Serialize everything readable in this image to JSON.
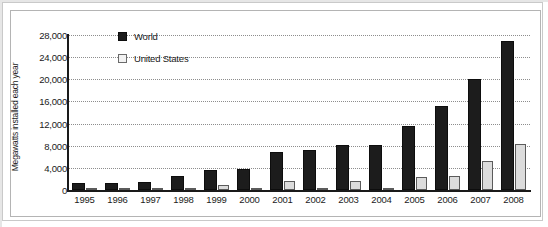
{
  "chart_data": {
    "type": "bar",
    "title": "",
    "xlabel": "",
    "ylabel": "Megawatts installed each year",
    "ylim": [
      0,
      28000
    ],
    "ytick_values": [
      0,
      4000,
      8000,
      12000,
      16000,
      20000,
      24000,
      28000
    ],
    "ytick_labels": [
      "0",
      "4,000",
      "8,000",
      "12,000",
      "16,000",
      "20,000",
      "24,000",
      "28,000"
    ],
    "grid": true,
    "legend_position": "upper-left-inside",
    "categories": [
      "1995",
      "1996",
      "1997",
      "1998",
      "1999",
      "2000",
      "2001",
      "2002",
      "2003",
      "2004",
      "2005",
      "2006",
      "2007",
      "2008"
    ],
    "series": [
      {
        "name": "World",
        "color": "#1c1c1c",
        "values": [
          1300,
          1200,
          1500,
          2600,
          3600,
          3800,
          6800,
          7200,
          8100,
          8200,
          11500,
          15200,
          20000,
          27000
        ]
      },
      {
        "name": "United States",
        "color": "#dcdcdc",
        "values": [
          50,
          30,
          30,
          150,
          900,
          60,
          1700,
          450,
          1700,
          400,
          2400,
          2500,
          5300,
          8400
        ]
      }
    ]
  },
  "legend": {
    "items": [
      {
        "label": "World",
        "swatch": "filled-black-square"
      },
      {
        "label": "United States",
        "swatch": "outlined-light-square"
      }
    ]
  },
  "caption": {
    "text": ""
  }
}
